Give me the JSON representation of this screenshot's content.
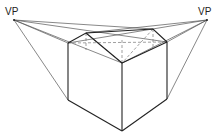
{
  "diagram": {
    "labels": {
      "vp_left": "VP",
      "vp_right": "VP"
    },
    "points": {
      "vp_left": [
        14,
        20
      ],
      "vp_right": [
        207,
        20
      ],
      "top_left": [
        68,
        43
      ],
      "top_back_left": [
        86,
        33
      ],
      "top_back_right": [
        153,
        29
      ],
      "top_right": [
        167,
        42
      ],
      "top_front": [
        122,
        63
      ],
      "bottom_left": [
        68,
        100
      ],
      "bottom_right": [
        167,
        99
      ],
      "bottom_front": [
        122,
        131
      ]
    },
    "colors": {
      "solid": "#222222",
      "guide": "#555555",
      "hidden": "#777777"
    }
  }
}
